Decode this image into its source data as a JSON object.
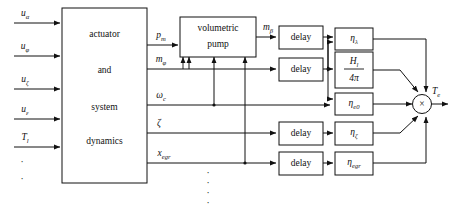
{
  "diagram": {
    "colors": {
      "line": "#111111",
      "block_fill": "#ffffff",
      "background": "#ffffff"
    },
    "blocks": {
      "actuator": {
        "lines": [
          "actuator",
          "and",
          "system",
          "dynamics"
        ]
      },
      "volumetric_pump": {
        "lines": [
          "volumetric",
          "pump"
        ]
      },
      "delay_label": "delay",
      "delays": [
        {
          "name": "delay-1",
          "label": "delay"
        },
        {
          "name": "delay-2",
          "label": "delay"
        },
        {
          "name": "delay-3",
          "label": "delay"
        },
        {
          "name": "delay-4",
          "label": "delay"
        }
      ],
      "efficiencies": [
        {
          "name": "eta-lambda",
          "base": "η",
          "sub": "λ"
        },
        {
          "name": "H-over-4pi",
          "numerator_base": "H",
          "numerator_sub": "l",
          "denominator": "4π"
        },
        {
          "name": "eta-e0",
          "base": "η",
          "sub": "e0"
        },
        {
          "name": "eta-zeta",
          "base": "η",
          "sub": "ζ"
        },
        {
          "name": "eta-egr",
          "base": "η",
          "sub": "egr"
        }
      ],
      "multiplier": {
        "symbol": "×"
      }
    },
    "inputs": [
      {
        "name": "u-alpha",
        "base": "u",
        "sub": "α"
      },
      {
        "name": "u-phi",
        "base": "u",
        "sub": "φ"
      },
      {
        "name": "u-zeta",
        "base": "u",
        "sub": "ζ"
      },
      {
        "name": "u-epsilon",
        "base": "u",
        "sub": "ε"
      },
      {
        "name": "T-l",
        "base": "T",
        "sub": "l"
      }
    ],
    "input_ellipsis": "·",
    "internal_signals": [
      {
        "name": "p-m",
        "base": "p",
        "sub": "m"
      },
      {
        "name": "m-phi",
        "base": "m",
        "sub": "φ"
      },
      {
        "name": "omega-c",
        "base": "ω",
        "sub": "c"
      },
      {
        "name": "zeta",
        "base": "ζ",
        "sub": ""
      },
      {
        "name": "x-egr",
        "base": "x",
        "sub": "egr"
      }
    ],
    "pump_output": {
      "name": "m-beta",
      "base": "m",
      "sub": "β"
    },
    "output": {
      "name": "T-e",
      "base": "T",
      "sub": "e"
    },
    "vertical_ellipsis": "·"
  }
}
